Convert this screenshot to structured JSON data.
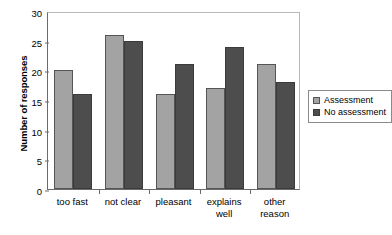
{
  "chart_data": {
    "type": "bar",
    "title": "",
    "subtitle": "",
    "xlabel": "",
    "ylabel": "Number of responses",
    "categories": [
      "too fast",
      "not clear",
      "pleasant",
      "explains well",
      "other reason"
    ],
    "category_lines": [
      [
        "too fast",
        ""
      ],
      [
        "not clear",
        ""
      ],
      [
        "pleasant",
        ""
      ],
      [
        "explains",
        "well"
      ],
      [
        "other",
        "reason"
      ]
    ],
    "series": [
      {
        "name": "Assessment",
        "color": "#a3a3a3",
        "values": [
          20,
          26,
          16,
          17,
          21
        ]
      },
      {
        "name": "No assessment",
        "color": "#4d4d4d",
        "values": [
          16,
          25,
          21,
          24,
          18
        ]
      }
    ],
    "ylim": [
      0,
      30
    ],
    "ytick_step": 5,
    "yticks": [
      0,
      5,
      10,
      15,
      20,
      25,
      30
    ],
    "ytick_labels": [
      "0",
      "5",
      "10",
      "15",
      "20",
      "25",
      "30"
    ],
    "grid": false,
    "legend_position": "right",
    "legend_entries": [
      "Assessment",
      "No assessment"
    ]
  }
}
